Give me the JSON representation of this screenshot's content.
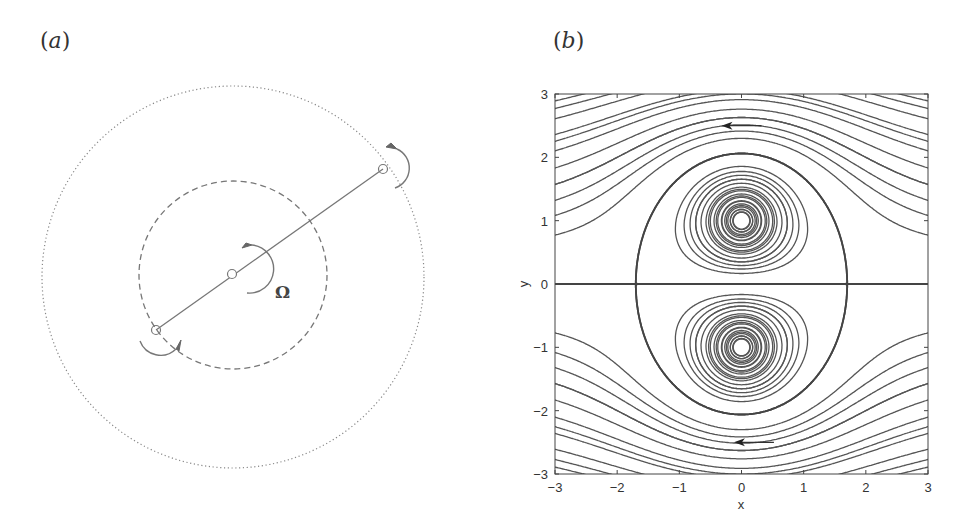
{
  "figure": {
    "panel_a": {
      "label_open": "(",
      "label_letter": "a",
      "label_close": ")",
      "omega_symbol": "Ω",
      "outer_circle": {
        "cx": 233,
        "cy": 277,
        "r": 191,
        "style": "dotted"
      },
      "inner_circle": {
        "cx": 233,
        "cy": 275,
        "r": 94,
        "style": "dashed"
      },
      "vortices": [
        {
          "name": "center",
          "x": 232,
          "y": 274
        },
        {
          "name": "outer",
          "x": 383,
          "y": 169
        },
        {
          "name": "inner",
          "x": 156,
          "y": 330
        }
      ]
    },
    "panel_b": {
      "label_open": "(",
      "label_letter": "b",
      "label_close": ")"
    }
  },
  "chart_data": {
    "type": "contour",
    "title": "",
    "xlabel": "x",
    "ylabel": "y",
    "xlim": [
      -3,
      3
    ],
    "ylim": [
      -3,
      3
    ],
    "xticks": [
      -3,
      -2,
      -1,
      0,
      1,
      2,
      3
    ],
    "yticks": [
      -3,
      -2,
      -1,
      0,
      1,
      2,
      3
    ],
    "xtick_labels": [
      "−3",
      "−2",
      "−1",
      "0",
      "1",
      "2",
      "3"
    ],
    "ytick_labels": [
      "−3",
      "−2",
      "−1",
      "0",
      "1",
      "2",
      "3"
    ],
    "grid": false,
    "vortex_centers": [
      [
        0,
        1
      ],
      [
        0,
        -1
      ]
    ],
    "saddle_points": [
      [
        -1.7,
        0
      ],
      [
        1.7,
        0
      ]
    ],
    "stream_function": "psi = U*y - 0.5*ln(x^2+(y-1)^2) + 0.5*ln(x^2+(y+1)^2)",
    "U": -0.514,
    "flow_arrows": [
      {
        "x": 0.0,
        "y": 2.5,
        "direction": "left"
      },
      {
        "x": 0.2,
        "y": -2.5,
        "direction": "left"
      }
    ],
    "closed_contour_levels": [
      2.14,
      1.9,
      1.7,
      1.5,
      1.32,
      1.16,
      1.02,
      0.9,
      0.78,
      0.66,
      0.55,
      0.45,
      0.36
    ],
    "open_contour_levels": [
      -0.25,
      -0.55,
      -0.85,
      -1.1,
      -1.35,
      -1.6,
      -1.9,
      -2.2
    ],
    "separatrix_level": 0.0
  }
}
